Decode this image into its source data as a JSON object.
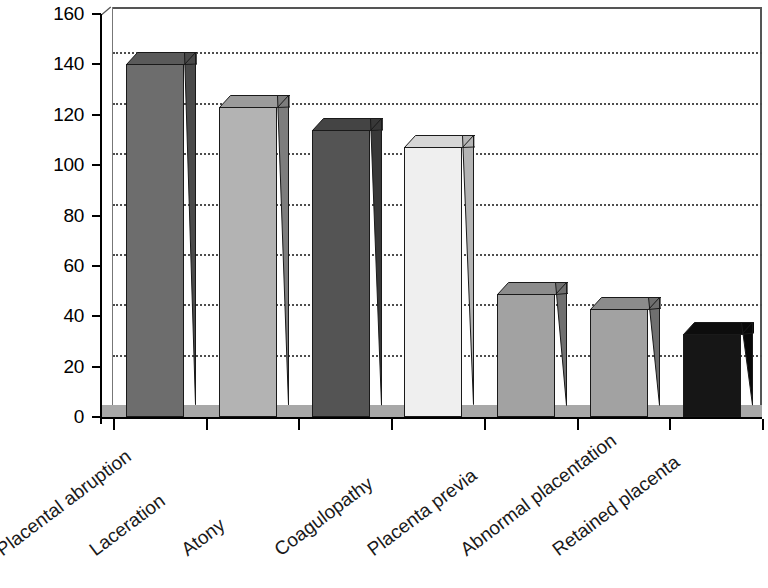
{
  "chart_data": {
    "type": "bar",
    "title": "",
    "subtitle": "",
    "xlabel": "",
    "ylabel": "",
    "categories": [
      "Placental abruption",
      "Laceration",
      "Atony",
      "Coagulopathy",
      "Placenta previa",
      "Abnormal placentation",
      "Retained placenta"
    ],
    "values": [
      140,
      123,
      114,
      107,
      49,
      43,
      33
    ],
    "ylim": [
      0,
      160
    ],
    "ytick_labels": [
      "0",
      "20",
      "40",
      "60",
      "80",
      "100",
      "120",
      "140",
      "160"
    ],
    "ytick_values": [
      0,
      20,
      40,
      60,
      80,
      100,
      120,
      140,
      160
    ],
    "grid": "horizontal-dotted",
    "legend": "none",
    "style": "3d-column",
    "bar_colors": [
      "#6d6d6d",
      "#b3b3b3",
      "#545454",
      "#efefef",
      "#a2a2a2",
      "#a2a2a2",
      "#161616"
    ],
    "bar_top_colors": [
      "#5a5a5a",
      "#9b9b9b",
      "#444444",
      "#d6d6d6",
      "#8c8c8c",
      "#8c8c8c",
      "#0d0d0d"
    ],
    "bar_side_colors": [
      "#4a4a4a",
      "#7d7d7d",
      "#383838",
      "#b4b4b4",
      "#6f6f6f",
      "#6f6f6f",
      "#080808"
    ]
  },
  "axes": {
    "y_axis_name": "y-axis",
    "x_axis_name": "x-axis"
  }
}
